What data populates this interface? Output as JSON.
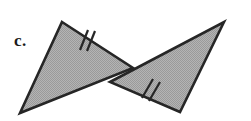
{
  "figure": {
    "label": "c.",
    "label_position": {
      "x": 14,
      "y": 32
    },
    "canvas": {
      "width": 251,
      "height": 121
    },
    "background_color": "#ffffff",
    "stroke_color": "#262626",
    "fill_color": "#a9a9a9",
    "fill_style": "halftone-dither-gray",
    "stroke_width": 2.6,
    "shapes": [
      {
        "name": "left-triangle",
        "points": "62,22 133,68 20,113",
        "vertices": [
          {
            "x": 62,
            "y": 22
          },
          {
            "x": 133,
            "y": 68
          },
          {
            "x": 20,
            "y": 113
          }
        ]
      },
      {
        "name": "right-triangle",
        "points": "224,22 180,112 110,82",
        "vertices": [
          {
            "x": 224,
            "y": 22
          },
          {
            "x": 180,
            "y": 112
          },
          {
            "x": 110,
            "y": 82
          }
        ]
      }
    ],
    "tick_marks": [
      {
        "name": "tick-mark-left-upper-edge",
        "count": 2,
        "on_segment": "62,22 to 133,68",
        "marks": [
          {
            "x1": 88,
            "y1": 30,
            "x2": 80,
            "y2": 50
          },
          {
            "x1": 95,
            "y1": 31,
            "x2": 87,
            "y2": 51
          }
        ]
      },
      {
        "name": "tick-mark-right-lower-edge",
        "count": 2,
        "on_segment": "110,82 to 180,112",
        "marks": [
          {
            "x1": 153,
            "y1": 79,
            "x2": 142,
            "y2": 98
          },
          {
            "x1": 160,
            "y1": 82,
            "x2": 149,
            "y2": 101
          }
        ]
      }
    ]
  }
}
